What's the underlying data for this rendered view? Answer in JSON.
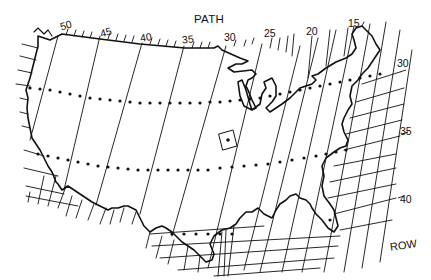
{
  "figure": {
    "axis_labels": {
      "path": "PATH",
      "row": "ROW"
    },
    "path_labels": [
      "50",
      "45",
      "40",
      "35",
      "30",
      "25",
      "20",
      "15"
    ],
    "row_labels": [
      "30",
      "35",
      "40"
    ],
    "colors": {
      "line": "#111111",
      "background": "#ffffff"
    },
    "features": {
      "dotted_rows": 3,
      "highlighted_scene": "small square marker with center dot near path 29 / row 34",
      "outline": "conterminous United States coastline and borders, including the Great Lakes"
    }
  }
}
